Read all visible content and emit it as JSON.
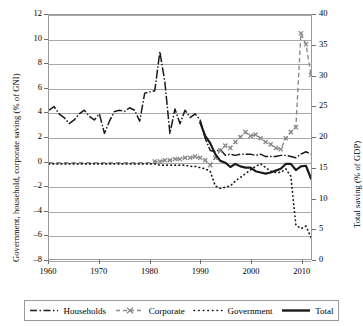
{
  "chart_data": {
    "type": "line",
    "title": "",
    "xlabel": "",
    "ylabel": "Government, household, corporate saving (% of GNI)",
    "y2label": "Total saving (% of GDP)",
    "xlim": [
      1960,
      2012
    ],
    "ylim": [
      -8,
      12
    ],
    "y2lim": [
      0,
      40
    ],
    "grid": true,
    "legend_position": "bottom",
    "xticks": [
      1960,
      1970,
      1980,
      1990,
      2000,
      2010
    ],
    "yticks": [
      -8,
      -6,
      -4,
      -2,
      0,
      2,
      4,
      6,
      8,
      10,
      12
    ],
    "y2ticks": [
      0,
      5,
      10,
      15,
      20,
      25,
      30,
      35,
      40
    ],
    "x": [
      1960,
      1961,
      1962,
      1963,
      1964,
      1965,
      1966,
      1967,
      1968,
      1969,
      1970,
      1971,
      1972,
      1973,
      1974,
      1975,
      1976,
      1977,
      1978,
      1979,
      1980,
      1981,
      1982,
      1983,
      1984,
      1985,
      1986,
      1987,
      1988,
      1989,
      1990,
      1991,
      1992,
      1993,
      1994,
      1995,
      1996,
      1997,
      1998,
      1999,
      2000,
      2001,
      2002,
      2003,
      2004,
      2005,
      2006,
      2007,
      2008,
      2009,
      2010,
      2011,
      2012
    ],
    "series": [
      {
        "name": "Households",
        "axis": "left",
        "style": "dash-dot",
        "values": [
          4.2,
          4.5,
          3.9,
          3.6,
          3.1,
          3.4,
          3.9,
          4.2,
          3.7,
          3.4,
          3.9,
          2.3,
          3.3,
          4.1,
          4.2,
          4.1,
          4.4,
          4.2,
          3.3,
          5.6,
          5.7,
          5.8,
          9.0,
          6.5,
          2.3,
          4.3,
          3.1,
          4.2,
          3.6,
          3.9,
          3.4,
          1.9,
          0.9,
          0.8,
          1.0,
          0.5,
          0.6,
          0.5,
          0.6,
          0.6,
          0.6,
          0.5,
          0.6,
          0.4,
          0.4,
          0.4,
          0.5,
          0.5,
          0.4,
          0.3,
          0.6,
          0.8,
          0.6
        ]
      },
      {
        "name": "Corporate",
        "axis": "left",
        "style": "dashed-x",
        "values": [
          -0.1,
          -0.1,
          -0.1,
          -0.1,
          -0.1,
          -0.1,
          -0.1,
          -0.1,
          -0.1,
          -0.1,
          -0.1,
          -0.1,
          -0.1,
          -0.1,
          -0.1,
          -0.1,
          -0.1,
          -0.1,
          -0.1,
          -0.1,
          -0.1,
          0.0,
          0.0,
          0.1,
          0.1,
          0.2,
          0.2,
          0.3,
          0.3,
          0.4,
          0.3,
          0.1,
          -0.3,
          0.3,
          0.9,
          1.3,
          1.1,
          1.6,
          2.0,
          2.4,
          2.1,
          2.2,
          1.9,
          1.6,
          1.4,
          1.1,
          1.0,
          1.9,
          2.4,
          2.8,
          2.5,
          1.1,
          0.2
        ],
        "spike_note": "series jumps to 10.5 then declines near 2010-2012",
        "late_values": {
          "2010": 10.5,
          "2011": 9.6,
          "2012": 7.1
        }
      },
      {
        "name": "Government",
        "axis": "left",
        "style": "dotted",
        "values": [
          -0.2,
          -0.2,
          -0.2,
          -0.2,
          -0.2,
          -0.2,
          -0.2,
          -0.2,
          -0.2,
          -0.2,
          -0.2,
          -0.2,
          -0.2,
          -0.2,
          -0.2,
          -0.2,
          -0.2,
          -0.2,
          -0.2,
          -0.2,
          -0.2,
          -0.2,
          -0.3,
          -0.3,
          -0.3,
          -0.3,
          -0.3,
          -0.3,
          -0.4,
          -0.4,
          -0.5,
          -0.6,
          -0.8,
          -2.0,
          -2.2,
          -2.1,
          -2.0,
          -1.6,
          -1.3,
          -1.0,
          -0.7,
          -0.4,
          -0.2,
          -0.5,
          -0.8,
          -0.9,
          -0.9,
          -0.6,
          -1.2,
          -5.2,
          -5.5,
          -5.3,
          -6.2
        ]
      },
      {
        "name": "Total",
        "axis": "right",
        "style": "solid-thick",
        "values_right": [
          null,
          null,
          null,
          null,
          null,
          null,
          null,
          null,
          null,
          null,
          null,
          null,
          null,
          null,
          null,
          null,
          null,
          null,
          null,
          null,
          null,
          null,
          null,
          null,
          null,
          null,
          null,
          null,
          null,
          null,
          22.4,
          20.2,
          19.0,
          17.2,
          16.1,
          15.8,
          15.1,
          15.6,
          15.2,
          15.0,
          15.0,
          14.4,
          14.2,
          14.0,
          14.2,
          14.5,
          14.8,
          15.6,
          15.6,
          14.6,
          15.2,
          15.3,
          13.2
        ]
      }
    ]
  },
  "axes": {
    "left": {
      "title": "Government, household, corporate saving (% of GNI)",
      "ticks": [
        "12",
        "10",
        "8",
        "6",
        "4",
        "2",
        "0",
        "–2",
        "–4",
        "–6",
        "–8"
      ]
    },
    "right": {
      "title": "Total saving (% of GDP)",
      "ticks": [
        "40",
        "35",
        "30",
        "25",
        "20",
        "15",
        "10",
        "5",
        "0"
      ]
    },
    "bottom": {
      "ticks": [
        "1960",
        "1970",
        "1980",
        "1990",
        "2000",
        "2010"
      ]
    }
  },
  "legend": {
    "items": [
      {
        "label": "Households",
        "symbol": "dash-dot-line"
      },
      {
        "label": "Corporate",
        "symbol": "dashed-x-line"
      },
      {
        "label": "Government",
        "symbol": "dotted-line"
      },
      {
        "label": "Total",
        "symbol": "solid-thick-line"
      }
    ]
  },
  "colors": {
    "series_dark": "#1a1a1a",
    "series_gray": "#8a8a8a",
    "grid": "#a8a8a8",
    "frame": "#9a9a9a",
    "background": "#ffffff"
  }
}
